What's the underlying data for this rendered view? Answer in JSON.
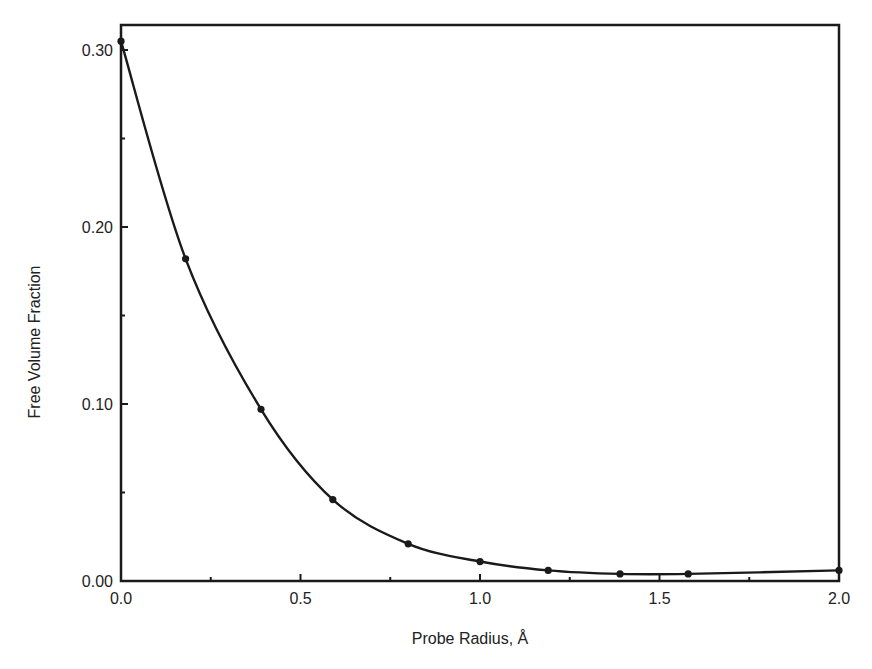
{
  "chart_data": {
    "type": "line",
    "title": "",
    "xlabel": "Probe Radius, Å",
    "ylabel": "Free Volume Fraction",
    "xlim": [
      0.0,
      2.0
    ],
    "ylim": [
      0.0,
      0.31
    ],
    "grid": false,
    "legend": null,
    "x_ticks": [
      "0.0",
      "0.5",
      "1.0",
      "1.5",
      "2.0"
    ],
    "x_tick_values": [
      0.0,
      0.5,
      1.0,
      1.5,
      2.0
    ],
    "x_minor_ticks": [
      0.25,
      0.75,
      1.25,
      1.75
    ],
    "y_ticks": [
      "0.00",
      "0.10",
      "0.20",
      "0.30"
    ],
    "y_tick_values": [
      0.0,
      0.1,
      0.2,
      0.3
    ],
    "y_minor_ticks": [
      0.05,
      0.15,
      0.25
    ],
    "series": [
      {
        "name": "Free Volume Fraction",
        "marker": "filled-circle",
        "smooth": true,
        "color": "#1a1a1a",
        "x": [
          0.0,
          0.18,
          0.39,
          0.59,
          0.8,
          1.0,
          1.19,
          1.39,
          1.58,
          2.0
        ],
        "values": [
          0.305,
          0.182,
          0.097,
          0.046,
          0.021,
          0.011,
          0.006,
          0.004,
          0.004,
          0.006
        ]
      }
    ]
  },
  "labels": {
    "xlabel": "Probe Radius, Å",
    "ylabel": "Free Volume Fraction"
  }
}
